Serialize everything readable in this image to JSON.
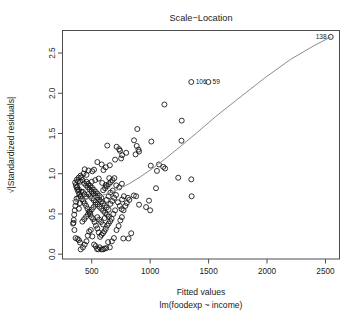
{
  "chart_data": {
    "type": "scatter",
    "title": "Scale−Location",
    "xlabel": "Fitted values",
    "xlabel_sub": "lm(foodexp ~ income)",
    "ylabel": "√|Standardized residuals|",
    "xlim": [
      250,
      2620
    ],
    "ylim": [
      -0.06,
      2.78
    ],
    "xticks": [
      500,
      1000,
      1500,
      2000,
      2500
    ],
    "xtick_labels": [
      "500",
      "1000",
      "1500",
      "2000",
      "2500"
    ],
    "yticks": [
      0.0,
      0.5,
      1.0,
      1.5,
      2.0,
      2.5
    ],
    "ytick_labels": [
      "0.0",
      "0.5",
      "1.0",
      "1.5",
      "2.0",
      "2.5"
    ],
    "grid": false,
    "legend": "none",
    "point_marker": "open-circle",
    "point_color": "#111111",
    "smoother_color": "#8c8c8c",
    "annotations": [
      {
        "label": "138",
        "x": 2545,
        "y": 2.7,
        "anchor": "right"
      },
      {
        "label": "106",
        "x": 1355,
        "y": 2.14,
        "anchor": "left"
      },
      {
        "label": "59",
        "x": 1500,
        "y": 2.14,
        "anchor": "left"
      }
    ],
    "points": [
      [
        2545,
        2.7
      ],
      [
        1352,
        2.14
      ],
      [
        1498,
        2.14
      ],
      [
        1122,
        1.86
      ],
      [
        1270,
        1.66
      ],
      [
        890,
        1.555
      ],
      [
        633,
        1.35
      ],
      [
        713,
        1.335
      ],
      [
        862,
        1.415
      ],
      [
        1010,
        1.4
      ],
      [
        885,
        1.345
      ],
      [
        900,
        1.3
      ],
      [
        905,
        1.275
      ],
      [
        875,
        1.24
      ],
      [
        795,
        1.26
      ],
      [
        760,
        1.23
      ],
      [
        742,
        1.285
      ],
      [
        735,
        1.305
      ],
      [
        752,
        1.19
      ],
      [
        700,
        1.175
      ],
      [
        1268,
        1.41
      ],
      [
        1075,
        1.115
      ],
      [
        1005,
        1.1
      ],
      [
        1112,
        1.085
      ],
      [
        1128,
        1.065
      ],
      [
        1058,
        1.035
      ],
      [
        1240,
        0.95
      ],
      [
        1352,
        0.93
      ],
      [
        1050,
        0.82
      ],
      [
        1355,
        0.72
      ],
      [
        990,
        0.665
      ],
      [
        1000,
        0.545
      ],
      [
        965,
        0.585
      ],
      [
        905,
        0.615
      ],
      [
        880,
        0.72
      ],
      [
        860,
        0.73
      ],
      [
        822,
        0.675
      ],
      [
        810,
        0.7
      ],
      [
        800,
        0.635
      ],
      [
        838,
        0.26
      ],
      [
        815,
        0.195
      ],
      [
        770,
        0.195
      ],
      [
        655,
        1.105
      ],
      [
        620,
        1.08
      ],
      [
        600,
        1.045
      ],
      [
        585,
        1.115
      ],
      [
        548,
        1.145
      ],
      [
        520,
        1.05
      ],
      [
        505,
        1.03
      ],
      [
        472,
        1.04
      ],
      [
        455,
        0.985
      ],
      [
        440,
        1.055
      ],
      [
        430,
        1.0
      ],
      [
        412,
        0.955
      ],
      [
        400,
        0.9
      ],
      [
        392,
        0.8
      ],
      [
        386,
        0.7
      ],
      [
        382,
        0.905
      ],
      [
        376,
        0.835
      ],
      [
        370,
        0.69
      ],
      [
        366,
        0.65
      ],
      [
        360,
        0.6
      ],
      [
        355,
        0.545
      ],
      [
        350,
        0.49
      ],
      [
        346,
        0.425
      ],
      [
        344,
        0.39
      ],
      [
        340,
        0.38
      ],
      [
        352,
        0.3
      ],
      [
        362,
        0.2
      ],
      [
        378,
        0.19
      ],
      [
        390,
        0.175
      ],
      [
        400,
        0.145
      ],
      [
        406,
        0.06
      ],
      [
        425,
        0.085
      ],
      [
        440,
        0.12
      ],
      [
        455,
        0.16
      ],
      [
        466,
        0.23
      ],
      [
        478,
        0.28
      ],
      [
        492,
        0.3
      ],
      [
        505,
        0.22
      ],
      [
        520,
        0.12
      ],
      [
        534,
        0.1
      ],
      [
        545,
        0.065
      ],
      [
        556,
        0.06
      ],
      [
        568,
        0.085
      ],
      [
        585,
        0.06
      ],
      [
        598,
        0.06
      ],
      [
        610,
        0.07
      ],
      [
        624,
        0.075
      ],
      [
        640,
        0.15
      ],
      [
        655,
        0.085
      ],
      [
        672,
        0.16
      ],
      [
        690,
        0.2
      ],
      [
        712,
        0.3
      ],
      [
        730,
        0.35
      ],
      [
        745,
        0.42
      ],
      [
        758,
        0.46
      ],
      [
        700,
        0.545
      ],
      [
        685,
        0.5
      ],
      [
        670,
        0.44
      ],
      [
        658,
        0.41
      ],
      [
        645,
        0.38
      ],
      [
        632,
        0.355
      ],
      [
        620,
        0.315
      ],
      [
        608,
        0.285
      ],
      [
        596,
        0.26
      ],
      [
        584,
        0.24
      ],
      [
        572,
        0.215
      ],
      [
        560,
        0.27
      ],
      [
        548,
        0.32
      ],
      [
        536,
        0.355
      ],
      [
        524,
        0.4
      ],
      [
        512,
        0.435
      ],
      [
        500,
        0.46
      ],
      [
        488,
        0.5
      ],
      [
        476,
        0.53
      ],
      [
        464,
        0.565
      ],
      [
        452,
        0.6
      ],
      [
        440,
        0.63
      ],
      [
        428,
        0.66
      ],
      [
        416,
        0.685
      ],
      [
        404,
        0.715
      ],
      [
        394,
        0.745
      ],
      [
        386,
        0.775
      ],
      [
        378,
        0.8
      ],
      [
        370,
        0.83
      ],
      [
        364,
        0.86
      ],
      [
        358,
        0.89
      ],
      [
        372,
        0.925
      ],
      [
        388,
        0.95
      ],
      [
        404,
        0.975
      ],
      [
        420,
        0.92
      ],
      [
        436,
        0.88
      ],
      [
        452,
        0.855
      ],
      [
        468,
        0.83
      ],
      [
        484,
        0.805
      ],
      [
        500,
        0.78
      ],
      [
        516,
        0.755
      ],
      [
        532,
        0.73
      ],
      [
        548,
        0.705
      ],
      [
        564,
        0.68
      ],
      [
        580,
        0.655
      ],
      [
        596,
        0.63
      ],
      [
        612,
        0.605
      ],
      [
        628,
        0.58
      ],
      [
        644,
        0.555
      ],
      [
        660,
        0.625
      ],
      [
        676,
        0.66
      ],
      [
        692,
        0.7
      ],
      [
        708,
        0.735
      ],
      [
        724,
        0.645
      ],
      [
        740,
        0.6
      ],
      [
        756,
        0.56
      ],
      [
        470,
        0.745
      ],
      [
        486,
        0.72
      ],
      [
        502,
        0.695
      ],
      [
        518,
        0.67
      ],
      [
        534,
        0.645
      ],
      [
        550,
        0.62
      ],
      [
        566,
        0.59
      ],
      [
        582,
        0.565
      ],
      [
        598,
        0.54
      ],
      [
        614,
        0.515
      ],
      [
        630,
        0.49
      ],
      [
        646,
        0.465
      ],
      [
        455,
        0.9
      ],
      [
        470,
        0.875
      ],
      [
        486,
        0.85
      ],
      [
        502,
        0.825
      ],
      [
        518,
        0.8
      ],
      [
        534,
        0.775
      ],
      [
        550,
        0.75
      ],
      [
        566,
        0.725
      ],
      [
        582,
        0.7
      ],
      [
        598,
        0.795
      ],
      [
        614,
        0.82
      ],
      [
        630,
        0.845
      ],
      [
        646,
        0.87
      ],
      [
        662,
        0.895
      ],
      [
        678,
        0.92
      ],
      [
        694,
        0.945
      ],
      [
        420,
        0.405
      ],
      [
        436,
        0.435
      ],
      [
        452,
        0.465
      ],
      [
        468,
        0.495
      ],
      [
        484,
        0.525
      ],
      [
        500,
        0.555
      ],
      [
        516,
        0.585
      ],
      [
        532,
        0.615
      ],
      [
        548,
        0.46
      ],
      [
        564,
        0.43
      ],
      [
        580,
        0.4
      ],
      [
        596,
        0.37
      ],
      [
        612,
        0.45
      ],
      [
        628,
        0.675
      ],
      [
        644,
        0.72
      ],
      [
        660,
        0.765
      ],
      [
        390,
        0.565
      ],
      [
        398,
        0.635
      ],
      [
        410,
        0.775
      ],
      [
        424,
        0.775
      ],
      [
        438,
        0.745
      ],
      [
        454,
        0.715
      ],
      [
        500,
        0.9
      ],
      [
        530,
        0.92
      ],
      [
        560,
        0.94
      ],
      [
        590,
        0.885
      ],
      [
        620,
        0.86
      ],
      [
        650,
        0.945
      ],
      [
        680,
        0.79
      ],
      [
        710,
        0.855
      ],
      [
        735,
        0.83
      ],
      [
        758,
        0.875
      ],
      [
        775,
        0.72
      ],
      [
        788,
        0.6
      ],
      [
        772,
        0.545
      ],
      [
        760,
        0.68
      ]
    ],
    "smoother": [
      [
        330,
        0.665
      ],
      [
        420,
        0.68
      ],
      [
        520,
        0.705
      ],
      [
        620,
        0.745
      ],
      [
        720,
        0.8
      ],
      [
        820,
        0.875
      ],
      [
        920,
        0.965
      ],
      [
        1020,
        1.065
      ],
      [
        1120,
        1.175
      ],
      [
        1260,
        1.34
      ],
      [
        1400,
        1.51
      ],
      [
        1560,
        1.71
      ],
      [
        1760,
        1.94
      ],
      [
        1980,
        2.19
      ],
      [
        2200,
        2.42
      ],
      [
        2400,
        2.59
      ],
      [
        2545,
        2.7
      ]
    ]
  }
}
